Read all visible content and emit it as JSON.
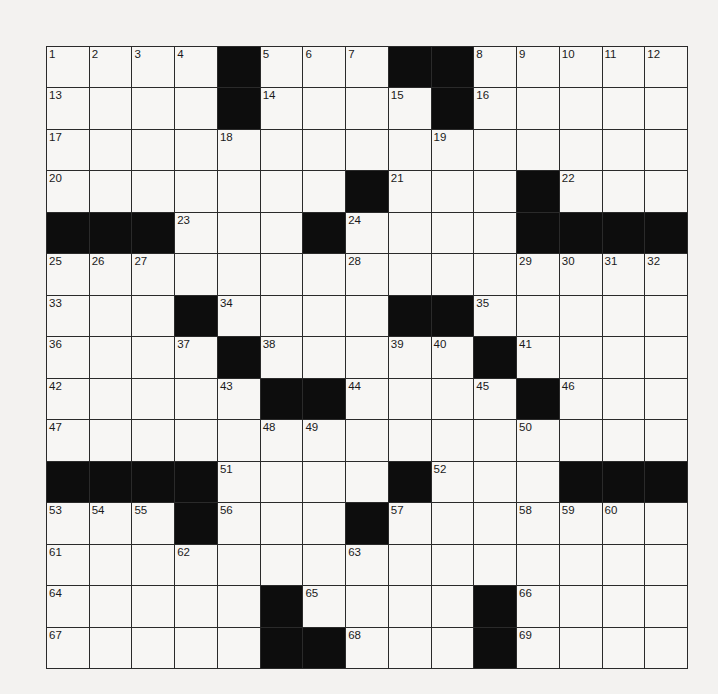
{
  "puzzle": {
    "rows": 15,
    "cols": 15,
    "colors": {
      "black_square": "#0d0d0d",
      "white_square": "#f7f6f4",
      "grid_line": "#2a2a2a"
    },
    "grid": [
      [
        "1",
        "2",
        "3",
        "4",
        "#",
        "5",
        "6",
        "7",
        "#",
        "#",
        "8",
        "9",
        "10",
        "11",
        "12"
      ],
      [
        "13",
        ".",
        ".",
        ".",
        "#",
        "14",
        ".",
        ".",
        "15",
        "#",
        "16",
        ".",
        ".",
        ".",
        "."
      ],
      [
        "17",
        ".",
        ".",
        ".",
        "18",
        ".",
        ".",
        ".",
        ".",
        "19",
        ".",
        ".",
        ".",
        ".",
        "."
      ],
      [
        "20",
        ".",
        ".",
        ".",
        ".",
        ".",
        ".",
        "#",
        "21",
        ".",
        ".",
        "#",
        "22",
        ".",
        "."
      ],
      [
        "#",
        "#",
        "#",
        "23",
        ".",
        ".",
        "#",
        "24",
        ".",
        ".",
        ".",
        "#",
        "#",
        "#",
        "#"
      ],
      [
        "25",
        "26",
        "27",
        ".",
        ".",
        ".",
        ".",
        "28",
        ".",
        ".",
        ".",
        "29",
        "30",
        "31",
        "32"
      ],
      [
        "33",
        ".",
        ".",
        "#",
        "34",
        ".",
        ".",
        ".",
        "#",
        "#",
        "35",
        ".",
        ".",
        ".",
        "."
      ],
      [
        "36",
        ".",
        ".",
        "37",
        "#",
        "38",
        ".",
        ".",
        "39",
        "40",
        "#",
        "41",
        ".",
        ".",
        "."
      ],
      [
        "42",
        ".",
        ".",
        ".",
        "43",
        "#",
        "#",
        "44",
        ".",
        ".",
        "45",
        "#",
        "46",
        ".",
        "."
      ],
      [
        "47",
        ".",
        ".",
        ".",
        ".",
        "48",
        "49",
        ".",
        ".",
        ".",
        ".",
        "50",
        ".",
        ".",
        "."
      ],
      [
        "#",
        "#",
        "#",
        "#",
        "51",
        ".",
        ".",
        ".",
        "#",
        "52",
        ".",
        ".",
        "#",
        "#",
        "#"
      ],
      [
        "53",
        "54",
        "55",
        "#",
        "56",
        ".",
        ".",
        "#",
        "57",
        ".",
        ".",
        "58",
        "59",
        "60",
        "."
      ],
      [
        "61",
        ".",
        ".",
        "62",
        ".",
        ".",
        ".",
        "63",
        ".",
        ".",
        ".",
        ".",
        ".",
        ".",
        "."
      ],
      [
        "64",
        ".",
        ".",
        ".",
        ".",
        "#",
        "65",
        ".",
        ".",
        ".",
        "#",
        "66",
        ".",
        ".",
        "."
      ],
      [
        "67",
        ".",
        ".",
        ".",
        ".",
        "#",
        "#",
        "68",
        ".",
        ".",
        "#",
        "69",
        ".",
        ".",
        "."
      ]
    ]
  }
}
